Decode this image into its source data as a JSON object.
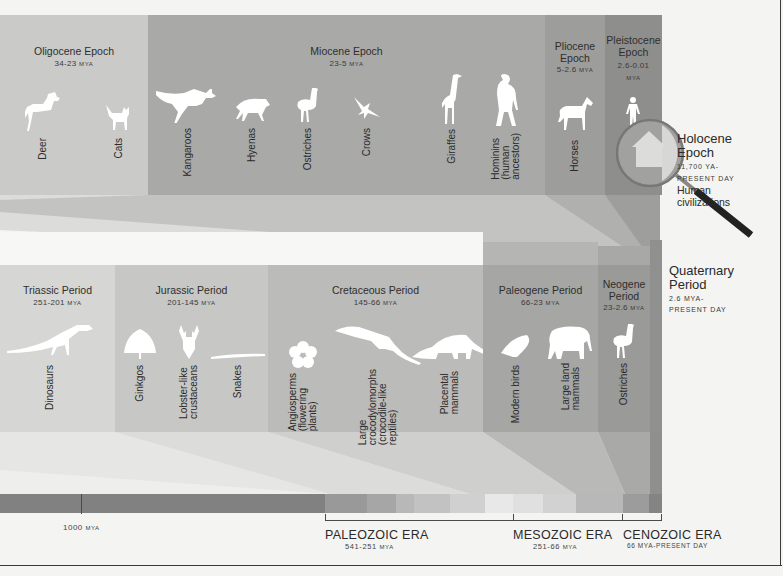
{
  "epochs": [
    {
      "name": "Oligocene Epoch",
      "range": "34-23",
      "unit": "MYA",
      "color": "#c9c9c7",
      "items": [
        {
          "label": "Deer",
          "icon": "deer-silhouette"
        },
        {
          "label": "Cats",
          "icon": "cat-silhouette"
        }
      ]
    },
    {
      "name": "Miocene Epoch",
      "range": "23-5",
      "unit": "MYA",
      "color": "#a9a9a7",
      "items": [
        {
          "label": "Kangaroos",
          "icon": "kangaroo-silhouette"
        },
        {
          "label": "Hyenas",
          "icon": "hyena-silhouette"
        },
        {
          "label": "Ostriches",
          "icon": "ostrich-silhouette"
        },
        {
          "label": "Crows",
          "icon": "crow-silhouette"
        },
        {
          "label": "Giraffes",
          "icon": "giraffe-silhouette"
        },
        {
          "label": "Hominins\n(human\nancestors)",
          "icon": "hominin-silhouette"
        }
      ]
    },
    {
      "name_line1": "Pliocene",
      "name_line2": "Epoch",
      "range": "5-2.6",
      "unit": "MYA",
      "color": "#9d9d9b",
      "items": [
        {
          "label": "Horses",
          "icon": "horse-silhouette"
        }
      ]
    },
    {
      "name_line1": "Pleistocene",
      "name_line2": "Epoch",
      "range": "2.6-0.01",
      "unit": "MYA",
      "color": "#8e8e8c",
      "items": [
        {
          "label": "Modern\nhumans",
          "icon": "human-silhouette"
        }
      ]
    }
  ],
  "holocene": {
    "title_line1": "Holocene",
    "title_line2": "Epoch",
    "range_line1": "11,700 YA-",
    "range_line2": "PRESENT DAY",
    "desc_line1": "Human",
    "desc_line2": "civilizations",
    "icon": "house-in-magnifier-icon"
  },
  "periods": [
    {
      "name": "Triassic Period",
      "range": "251-201",
      "unit": "MYA",
      "color": "#d6d6d4",
      "items": [
        {
          "label": "Dinosaurs",
          "icon": "dinosaur-silhouette"
        }
      ]
    },
    {
      "name": "Jurassic Period",
      "range": "201-145",
      "unit": "MYA",
      "color": "#c8c8c6",
      "items": [
        {
          "label": "Ginkgos",
          "icon": "ginkgo-silhouette"
        },
        {
          "label": "Lobster-like\ncrustaceans",
          "icon": "lobster-silhouette"
        },
        {
          "label": "Snakes",
          "icon": "snake-silhouette"
        }
      ]
    },
    {
      "name": "Cretaceous Period",
      "range": "145-66",
      "unit": "MYA",
      "color": "#bbbbb9",
      "items": [
        {
          "label": "Angiosperms\n(flowering\nplants)",
          "icon": "flower-silhouette"
        },
        {
          "label": "Large\ncrocodylomorphs\n(crocodile-like\nreptiles)",
          "icon": "crocodile-silhouette"
        },
        {
          "label": "Placental\nmammals",
          "icon": "anteater-silhouette"
        }
      ]
    },
    {
      "name": "Paleogene Period",
      "range": "66-23",
      "unit": "MYA",
      "color": "#a6a6a4",
      "items": [
        {
          "label": "Modern birds",
          "icon": "bird-silhouette"
        },
        {
          "label": "Large land\nmammals",
          "icon": "elephant-silhouette"
        }
      ]
    },
    {
      "name_line1": "Neogene",
      "name_line2": "Period",
      "range": "23-2.6",
      "unit": "MYA",
      "color": "#9a9a98",
      "items": [
        {
          "label": "Ostriches",
          "icon": "ostrich-silhouette"
        }
      ]
    }
  ],
  "quaternary": {
    "title_line1": "Quaternary",
    "title_line2": "Period",
    "range_line1": "2.6 MYA-",
    "range_line2": "PRESENT DAY"
  },
  "timeline": {
    "tick_label": "1000",
    "tick_unit": "MYA",
    "eras": [
      {
        "name": "PALEOZOIC ERA",
        "range": "541-251",
        "unit": "MYA"
      },
      {
        "name": "MESOZOIC ERA",
        "range": "251-66",
        "unit": "MYA"
      },
      {
        "name": "CENOZOIC ERA",
        "range": "66 MYA-PRESENT DAY"
      }
    ]
  }
}
